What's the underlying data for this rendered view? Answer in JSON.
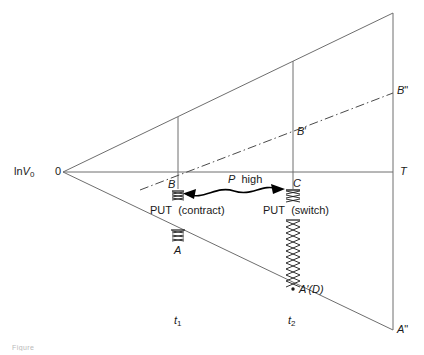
{
  "figure": {
    "type": "geometric-diagram",
    "background_color": "#ffffff",
    "line_color": "#6e6e6e",
    "text_color": "#1a1a1a"
  },
  "axes": {
    "y_axis_label": "ln V",
    "y_axis_label_sub": "0",
    "origin_label": "0",
    "horizontal_end_label": "T"
  },
  "time_ticks": [
    {
      "name": "t1",
      "label": "t",
      "sub": "1",
      "x": 178
    },
    {
      "name": "t2",
      "label": "t",
      "sub": "2",
      "x": 293
    }
  ],
  "points": [
    {
      "id": "B",
      "label": "B",
      "prime": "",
      "x": 178,
      "y": 188
    },
    {
      "id": "C",
      "label": "C",
      "prime": "",
      "x": 293,
      "y": 188
    },
    {
      "id": "A",
      "label": "A",
      "prime": "",
      "x": 178,
      "y": 243
    },
    {
      "id": "Bprime",
      "label": "B",
      "prime": "'",
      "x": 293,
      "y": 132
    },
    {
      "id": "Bdprime",
      "label": "B",
      "prime": "\"",
      "x": 393,
      "y": 92
    },
    {
      "id": "AprimeD",
      "label": "A'(D)",
      "prime": "",
      "x": 293,
      "y": 290
    },
    {
      "id": "Adprime",
      "label": "A",
      "prime": "\"",
      "x": 393,
      "y": 330
    }
  ],
  "annotations": {
    "p_high": {
      "italic": "P",
      "text": "high"
    },
    "put_contract": {
      "prefix": "PUT",
      "paren": "(contract)"
    },
    "put_switch": {
      "prefix": "PUT",
      "paren": "(switch)"
    }
  },
  "caption_fragment": "Figure"
}
